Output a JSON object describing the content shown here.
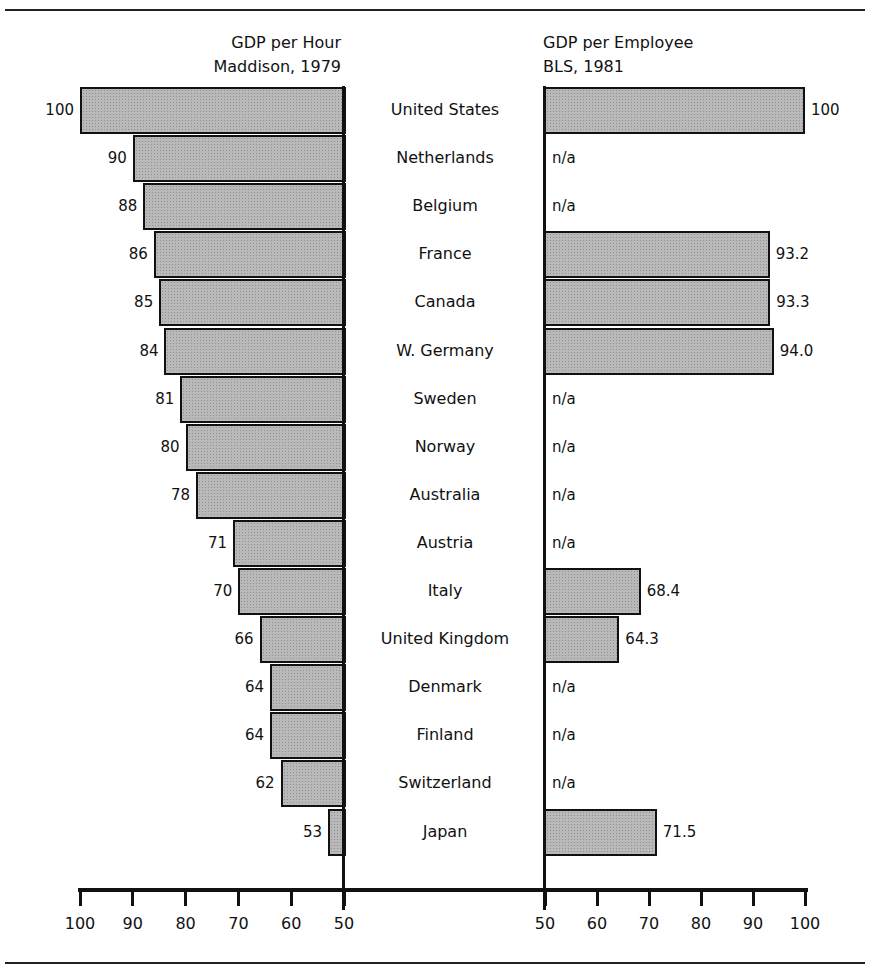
{
  "chart_data": {
    "type": "bar",
    "layout": "back-to-back horizontal bars",
    "categories": [
      "United States",
      "Netherlands",
      "Belgium",
      "France",
      "Canada",
      "W. Germany",
      "Sweden",
      "Norway",
      "Australia",
      "Austria",
      "Italy",
      "United Kingdom",
      "Denmark",
      "Finland",
      "Switzerland",
      "Japan"
    ],
    "series": [
      {
        "name": "GDP per Hour",
        "title_lines": [
          "GDP per Hour",
          "Maddison, 1979"
        ],
        "side": "left",
        "values": [
          100,
          90,
          88,
          86,
          85,
          84,
          81,
          80,
          78,
          71,
          70,
          66,
          64,
          64,
          62,
          53
        ],
        "labels": [
          "100",
          "90",
          "88",
          "86",
          "85",
          "84",
          "81",
          "80",
          "78",
          "71",
          "70",
          "66",
          "64",
          "64",
          "62",
          "53"
        ]
      },
      {
        "name": "GDP per Employee",
        "title_lines": [
          "GDP per Employee",
          "BLS, 1981"
        ],
        "side": "right",
        "values": [
          100,
          null,
          null,
          93.2,
          93.3,
          94.0,
          null,
          null,
          null,
          null,
          68.4,
          64.3,
          null,
          null,
          null,
          71.5
        ],
        "labels": [
          "100",
          "n/a",
          "n/a",
          "93.2",
          "93.3",
          "94.0",
          "n/a",
          "n/a",
          "n/a",
          "n/a",
          "68.4",
          "64.3",
          "n/a",
          "n/a",
          "n/a",
          "71.5"
        ]
      }
    ],
    "left_axis": {
      "ticks": [
        100,
        90,
        80,
        70,
        60,
        50
      ],
      "range": [
        100,
        50
      ]
    },
    "right_axis": {
      "ticks": [
        50,
        60,
        70,
        80,
        90,
        100
      ],
      "range": [
        50,
        100
      ]
    },
    "xlabel": "",
    "ylabel": "",
    "grid": false,
    "legend": "none",
    "bar_color": "#b9b9b9"
  },
  "titles": {
    "left_line1": "GDP per Hour",
    "left_line2": "Maddison, 1979",
    "right_line1": "GDP per Employee",
    "right_line2": "BLS, 1981"
  },
  "na_label": "n/a"
}
